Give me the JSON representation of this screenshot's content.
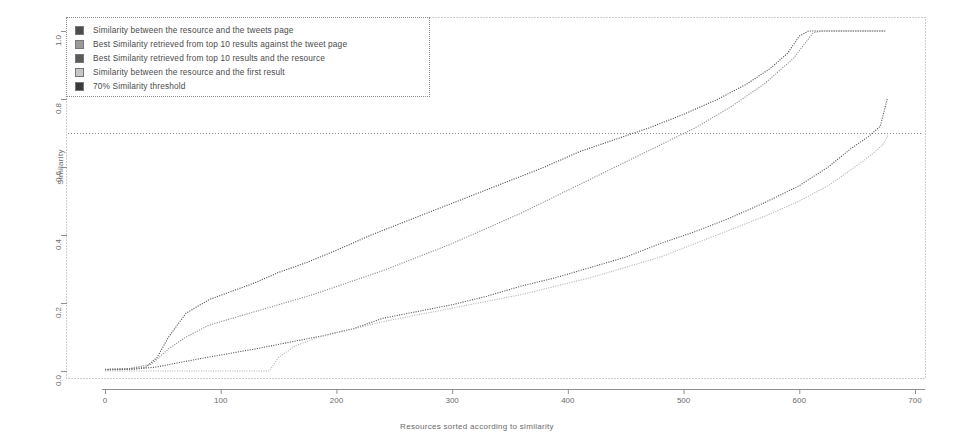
{
  "chart_data": {
    "type": "line",
    "title": "",
    "xlabel": "Resources sorted according to similarity",
    "ylabel": "Similarity",
    "xlim": [
      0,
      700
    ],
    "ylim": [
      0.0,
      1.0
    ],
    "xticks": [
      0,
      100,
      200,
      300,
      400,
      500,
      600,
      700
    ],
    "xtick_labels": [
      "0",
      "100",
      "200",
      "300",
      "400",
      "500",
      "600",
      "700"
    ],
    "yticks": [
      0.0,
      0.2,
      0.4,
      0.6,
      0.8,
      1.0
    ],
    "ytick_labels": [
      "0.0",
      "0.2",
      "0.4",
      "0.6",
      "0.8",
      "1.0"
    ],
    "grid": false,
    "legend_position": "upper-left",
    "threshold_value": 0.7,
    "series": [
      {
        "name": "Similarity between the resource and the tweets page",
        "color": "#4d4d4d",
        "swatch": "#4d4d4d",
        "style": "dotted",
        "x": [
          0,
          20,
          35,
          45,
          55,
          70,
          90,
          110,
          130,
          150,
          175,
          200,
          230,
          260,
          290,
          320,
          350,
          380,
          410,
          440,
          470,
          500,
          530,
          555,
          575,
          590,
          600,
          608,
          615,
          640,
          675
        ],
        "y": [
          0.005,
          0.007,
          0.01,
          0.04,
          0.1,
          0.17,
          0.21,
          0.235,
          0.26,
          0.29,
          0.32,
          0.355,
          0.4,
          0.44,
          0.48,
          0.52,
          0.56,
          0.6,
          0.645,
          0.68,
          0.715,
          0.755,
          0.8,
          0.845,
          0.89,
          0.935,
          0.985,
          1.0,
          1.0,
          1.0,
          1.0
        ]
      },
      {
        "name": "Best Similarity retrieved from top 10 results against the tweet page",
        "color": "#8a8a8a",
        "swatch": "#9a9a9a",
        "style": "dotted",
        "x": [
          0,
          20,
          40,
          55,
          70,
          90,
          110,
          130,
          150,
          180,
          210,
          240,
          270,
          300,
          330,
          360,
          390,
          420,
          450,
          480,
          510,
          540,
          570,
          595,
          612,
          620,
          635,
          660,
          675
        ],
        "y": [
          0.004,
          0.006,
          0.02,
          0.065,
          0.1,
          0.135,
          0.155,
          0.175,
          0.195,
          0.225,
          0.26,
          0.295,
          0.335,
          0.375,
          0.42,
          0.465,
          0.515,
          0.565,
          0.615,
          0.665,
          0.715,
          0.775,
          0.845,
          0.92,
          0.995,
          1.0,
          1.0,
          1.0,
          1.0
        ]
      },
      {
        "name": "Best Similarity retrieved from top 10 results and the resource",
        "color": "#5a5a5a",
        "swatch": "#5a5a5a",
        "style": "dotted",
        "x": [
          0,
          25,
          45,
          60,
          80,
          105,
          130,
          160,
          190,
          215,
          240,
          270,
          300,
          330,
          360,
          390,
          420,
          450,
          480,
          510,
          540,
          570,
          600,
          625,
          645,
          660,
          670,
          676
        ],
        "y": [
          0.003,
          0.005,
          0.012,
          0.022,
          0.035,
          0.05,
          0.065,
          0.085,
          0.105,
          0.125,
          0.155,
          0.175,
          0.195,
          0.22,
          0.25,
          0.275,
          0.305,
          0.335,
          0.375,
          0.41,
          0.45,
          0.495,
          0.545,
          0.6,
          0.655,
          0.69,
          0.72,
          0.8
        ]
      },
      {
        "name": "Similarity between the resource and the first result",
        "color": "#b4b4b4",
        "swatch": "#c6c6c6",
        "style": "dotted",
        "x": [
          0,
          40,
          80,
          110,
          135,
          142,
          150,
          165,
          185,
          210,
          240,
          270,
          300,
          330,
          360,
          390,
          420,
          450,
          480,
          510,
          540,
          570,
          600,
          625,
          648,
          662,
          672,
          677
        ],
        "y": [
          0.0,
          0.0,
          0.0,
          0.0,
          0.0,
          0.0,
          0.04,
          0.075,
          0.1,
          0.12,
          0.145,
          0.165,
          0.185,
          0.205,
          0.225,
          0.25,
          0.275,
          0.305,
          0.335,
          0.375,
          0.415,
          0.455,
          0.5,
          0.545,
          0.6,
          0.635,
          0.665,
          0.695
        ]
      }
    ],
    "threshold_series": {
      "name": "70% Similarity threshold",
      "color": "#8c8c8c",
      "swatch": "#3a3a3a",
      "value": 0.7
    }
  },
  "legend": {
    "items": [
      {
        "label": "Similarity between the resource and the tweets page"
      },
      {
        "label": "Best Similarity retrieved from top 10 results against the tweet page"
      },
      {
        "label": "Best Similarity retrieved from top 10 results and the resource"
      },
      {
        "label": "Similarity between the resource and the first result"
      },
      {
        "label": "70% Similarity threshold"
      }
    ]
  }
}
